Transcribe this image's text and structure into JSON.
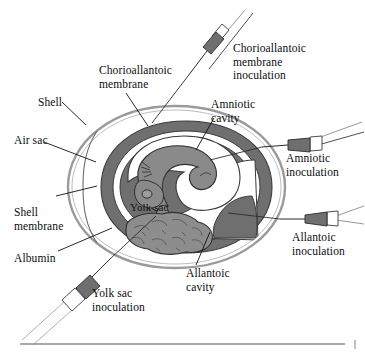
{
  "figure": {
    "anatomy_labels": [
      {
        "id": "shell",
        "text": "Shell",
        "x": 38,
        "y": 96
      },
      {
        "id": "air-sac",
        "text": "Air sac",
        "x": 14,
        "y": 134
      },
      {
        "id": "shell-membrane",
        "text": "Shell\nmembrane",
        "x": 14,
        "y": 206
      },
      {
        "id": "albumin",
        "text": "Albumin",
        "x": 14,
        "y": 252
      },
      {
        "id": "chorioallantoic-membrane",
        "text": "Chorioallantoic\nmembrane",
        "x": 99,
        "y": 64
      },
      {
        "id": "amniotic-cavity",
        "text": "Amniotic\ncavity",
        "x": 211,
        "y": 98
      },
      {
        "id": "allantoic-cavity",
        "text": "Allantoic\ncavity",
        "x": 186,
        "y": 267
      },
      {
        "id": "yolk-sac",
        "text": "Yolk sac",
        "x": 130,
        "y": 201
      }
    ],
    "inoculation_labels": [
      {
        "id": "chorioallantoic-membrane-inoculation",
        "text": "Chorioallantoic\nmembrane\ninoculation",
        "x": 233,
        "y": 42
      },
      {
        "id": "amniotic-inoculation",
        "text": "Amniotic\ninoculation",
        "x": 286,
        "y": 152
      },
      {
        "id": "allantoic-inoculation",
        "text": "Allantoic\ninoculation",
        "x": 292,
        "y": 231
      },
      {
        "id": "yolk-sac-inoculation",
        "text": "Yolk sac\ninoculation",
        "x": 92,
        "y": 287
      }
    ],
    "colors": {
      "ink": "#0d0d0d",
      "shell_line": "#9a9a9a",
      "membrane_gray": "#6f6f6f",
      "yolk_gray": "#8d8d8d",
      "embryo_gray": "#8a8a8a",
      "cavity_white": "#ffffff",
      "rule": "#8c8c8c"
    }
  }
}
